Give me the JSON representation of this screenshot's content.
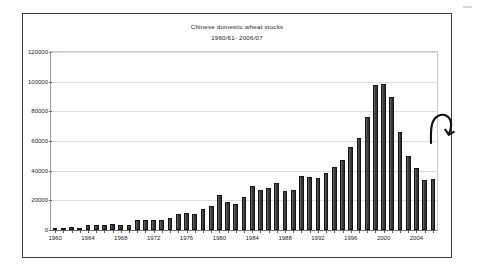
{
  "chart_data": {
    "type": "bar",
    "title": "Chinese domestic wheat stocks",
    "subtitle": "1960/61- 2006/07",
    "xlabel": "",
    "ylabel": "",
    "ylim": [
      0,
      120000
    ],
    "ytick_step": 20000,
    "yticks": [
      "0",
      "20000",
      "40000",
      "60000",
      "80000",
      "100000",
      "120000"
    ],
    "grid": true,
    "legend": false,
    "legend_position": "none",
    "bar_color": "#3c3c3c",
    "xtick_labels_every": 4,
    "categories": [
      "1960",
      "1961",
      "1962",
      "1963",
      "1964",
      "1965",
      "1966",
      "1967",
      "1968",
      "1969",
      "1970",
      "1971",
      "1972",
      "1973",
      "1974",
      "1975",
      "1976",
      "1977",
      "1978",
      "1979",
      "1980",
      "1981",
      "1982",
      "1983",
      "1984",
      "1985",
      "1986",
      "1987",
      "1988",
      "1989",
      "1990",
      "1991",
      "1992",
      "1993",
      "1994",
      "1995",
      "1996",
      "1997",
      "1998",
      "1999",
      "2000",
      "2001",
      "2002",
      "2003",
      "2004",
      "2005",
      "2006"
    ],
    "values": [
      1600,
      1500,
      2200,
      800,
      3200,
      3300,
      3100,
      4200,
      3300,
      3300,
      6800,
      6600,
      6500,
      6600,
      8000,
      10500,
      11500,
      10500,
      14000,
      16500,
      23500,
      19000,
      17500,
      22000,
      29500,
      27000,
      28500,
      31500,
      26500,
      27000,
      36500,
      36000,
      35000,
      38500,
      42500,
      47000,
      56000,
      62000,
      76000,
      97500,
      98500,
      90000,
      66000,
      50000,
      42000,
      34000,
      34500
    ],
    "annotation": {
      "type": "hand-drawn-hook-arrow",
      "label": "",
      "points_at": "2000"
    }
  }
}
